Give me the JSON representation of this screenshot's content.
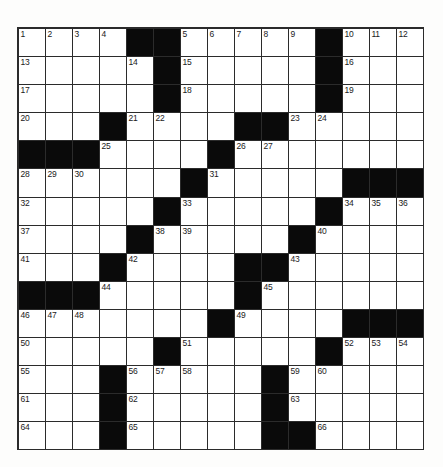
{
  "puzzle": {
    "title": "Crossword Grid",
    "rows": 15,
    "cols": 15,
    "cell_size_px": 27,
    "colors": {
      "block": "#0a0a0a",
      "cell": "#ffffff",
      "border": "#2b2b2b",
      "number": "#1a1a1a",
      "background": "#fdfdfc"
    },
    "grid": [
      "....##.....#...",
      ".....#.....#...",
      ".....#.....#...",
      "...#....##.....",
      "###....#.......",
      "......#.....###",
      ".....#.....#...",
      "....#.....#....",
      "...#....##.....",
      "###.....#......",
      ".......#....###",
      ".....#.....#...",
      "...#.....#.....",
      "...#.....#.....",
      "...#.....##...."
    ],
    "numbers": [
      {
        "row": 0,
        "col": 0,
        "n": "1"
      },
      {
        "row": 0,
        "col": 1,
        "n": "2"
      },
      {
        "row": 0,
        "col": 2,
        "n": "3"
      },
      {
        "row": 0,
        "col": 3,
        "n": "4"
      },
      {
        "row": 0,
        "col": 6,
        "n": "5"
      },
      {
        "row": 0,
        "col": 7,
        "n": "6"
      },
      {
        "row": 0,
        "col": 8,
        "n": "7"
      },
      {
        "row": 0,
        "col": 9,
        "n": "8"
      },
      {
        "row": 0,
        "col": 10,
        "n": "9"
      },
      {
        "row": 0,
        "col": 12,
        "n": "10"
      },
      {
        "row": 0,
        "col": 13,
        "n": "11"
      },
      {
        "row": 0,
        "col": 14,
        "n": "12"
      },
      {
        "row": 1,
        "col": 0,
        "n": "13"
      },
      {
        "row": 1,
        "col": 4,
        "n": "14"
      },
      {
        "row": 1,
        "col": 6,
        "n": "15"
      },
      {
        "row": 1,
        "col": 12,
        "n": "16"
      },
      {
        "row": 2,
        "col": 0,
        "n": "17"
      },
      {
        "row": 2,
        "col": 6,
        "n": "18"
      },
      {
        "row": 2,
        "col": 12,
        "n": "19"
      },
      {
        "row": 3,
        "col": 0,
        "n": "20"
      },
      {
        "row": 3,
        "col": 4,
        "n": "21"
      },
      {
        "row": 3,
        "col": 5,
        "n": "22"
      },
      {
        "row": 3,
        "col": 10,
        "n": "23"
      },
      {
        "row": 3,
        "col": 11,
        "n": "24"
      },
      {
        "row": 4,
        "col": 3,
        "n": "25"
      },
      {
        "row": 4,
        "col": 8,
        "n": "26"
      },
      {
        "row": 4,
        "col": 9,
        "n": "27"
      },
      {
        "row": 5,
        "col": 0,
        "n": "28"
      },
      {
        "row": 5,
        "col": 1,
        "n": "29"
      },
      {
        "row": 5,
        "col": 2,
        "n": "30"
      },
      {
        "row": 5,
        "col": 7,
        "n": "31"
      },
      {
        "row": 6,
        "col": 0,
        "n": "32"
      },
      {
        "row": 6,
        "col": 6,
        "n": "33"
      },
      {
        "row": 6,
        "col": 12,
        "n": "34"
      },
      {
        "row": 6,
        "col": 13,
        "n": "35"
      },
      {
        "row": 6,
        "col": 14,
        "n": "36"
      },
      {
        "row": 7,
        "col": 0,
        "n": "37"
      },
      {
        "row": 7,
        "col": 5,
        "n": "38"
      },
      {
        "row": 7,
        "col": 6,
        "n": "39"
      },
      {
        "row": 7,
        "col": 11,
        "n": "40"
      },
      {
        "row": 8,
        "col": 0,
        "n": "41"
      },
      {
        "row": 8,
        "col": 4,
        "n": "42"
      },
      {
        "row": 8,
        "col": 10,
        "n": "43"
      },
      {
        "row": 9,
        "col": 3,
        "n": "44"
      },
      {
        "row": 9,
        "col": 9,
        "n": "45"
      },
      {
        "row": 10,
        "col": 0,
        "n": "46"
      },
      {
        "row": 10,
        "col": 1,
        "n": "47"
      },
      {
        "row": 10,
        "col": 2,
        "n": "48"
      },
      {
        "row": 10,
        "col": 8,
        "n": "49"
      },
      {
        "row": 11,
        "col": 0,
        "n": "50"
      },
      {
        "row": 11,
        "col": 6,
        "n": "51"
      },
      {
        "row": 11,
        "col": 12,
        "n": "52"
      },
      {
        "row": 11,
        "col": 13,
        "n": "53"
      },
      {
        "row": 11,
        "col": 14,
        "n": "54"
      },
      {
        "row": 12,
        "col": 0,
        "n": "55"
      },
      {
        "row": 12,
        "col": 4,
        "n": "56"
      },
      {
        "row": 12,
        "col": 5,
        "n": "57"
      },
      {
        "row": 12,
        "col": 6,
        "n": "58"
      },
      {
        "row": 12,
        "col": 10,
        "n": "59"
      },
      {
        "row": 12,
        "col": 11,
        "n": "60"
      },
      {
        "row": 13,
        "col": 0,
        "n": "61"
      },
      {
        "row": 13,
        "col": 4,
        "n": "62"
      },
      {
        "row": 13,
        "col": 10,
        "n": "63"
      },
      {
        "row": 14,
        "col": 0,
        "n": "64"
      },
      {
        "row": 14,
        "col": 4,
        "n": "65"
      },
      {
        "row": 14,
        "col": 11,
        "n": "66"
      }
    ],
    "entries": []
  }
}
